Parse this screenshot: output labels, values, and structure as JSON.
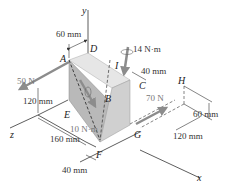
{
  "diagram": {
    "type": "3D statics free-body figure",
    "axes": {
      "x": "x",
      "y": "y",
      "z": "z"
    },
    "points": {
      "A": "A",
      "B": "B",
      "C": "C",
      "D": "D",
      "E": "E",
      "F": "F",
      "G": "G",
      "H": "H",
      "I": "I"
    },
    "forces": {
      "f50": "50 N",
      "f70": "70 N"
    },
    "couples": {
      "m14": "14 N·m",
      "m10": "10 N·m"
    },
    "dimensions": {
      "d60_top": "60 mm",
      "d40_top": "40 mm",
      "d120_left": "120 mm",
      "d160": "160 mm",
      "d40_bottom": "40 mm",
      "d60_right": "60 mm",
      "d120_right": "120 mm"
    },
    "colors": {
      "block_front": "#b9b9b9",
      "block_top": "#e6e6e6",
      "block_side": "#d0d0d0",
      "arrow": "#8c8c8c",
      "line": "#333333"
    }
  }
}
